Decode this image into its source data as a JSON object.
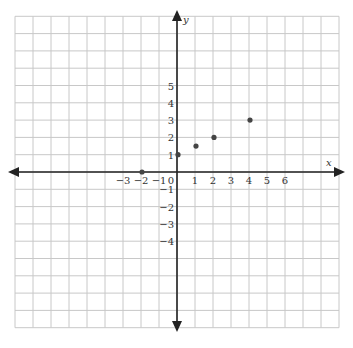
{
  "chart_data": {
    "type": "scatter",
    "title": "",
    "xlabel": "x",
    "ylabel": "y",
    "xlim": [
      -9,
      9
    ],
    "ylim": [
      -9,
      9
    ],
    "grid": true,
    "x_ticks": [
      -3,
      -2,
      -1,
      0,
      1,
      2,
      3,
      4,
      5,
      6
    ],
    "y_ticks": [
      5,
      4,
      3,
      2,
      1,
      -1,
      -2,
      -3,
      -4
    ],
    "x_tick_labels": [
      "−3",
      "−2",
      "−1",
      "0",
      "1",
      "2",
      "3",
      "4",
      "5",
      "6"
    ],
    "y_tick_labels": [
      "5",
      "4",
      "3",
      "2",
      "1",
      "−1",
      "−2",
      "−3",
      "−4"
    ],
    "points": [
      {
        "x": -2,
        "y": 0
      },
      {
        "x": 0,
        "y": 1
      },
      {
        "x": 1,
        "y": 1.5
      },
      {
        "x": 2,
        "y": 2
      },
      {
        "x": 4,
        "y": 3
      }
    ]
  },
  "colors": {
    "grid": "#c8c8c8",
    "axis": "#222222",
    "point": "#444444"
  }
}
